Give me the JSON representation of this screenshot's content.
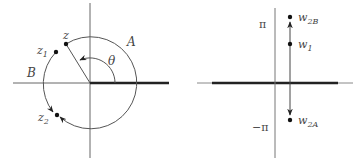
{
  "left_panel": {
    "labels": {
      "z": "z",
      "z1_base": "z",
      "z1_sub": "1",
      "z2_base": "z",
      "z2_sub": "2",
      "A": "A",
      "B": "B",
      "theta": "θ"
    }
  },
  "right_panel": {
    "labels": {
      "pi": "π",
      "neg_pi": "−π",
      "w1_base": "w",
      "w1_sub": "1",
      "w2B_base": "w",
      "w2B_sub": "2B",
      "w2A_base": "w",
      "w2A_sub": "2A"
    }
  },
  "colors": {
    "line": "#555555",
    "cut": "#222222",
    "text": "#444444"
  }
}
